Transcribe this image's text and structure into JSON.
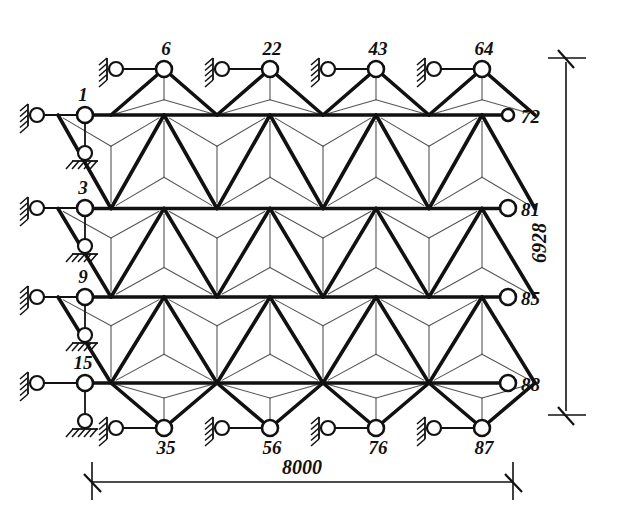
{
  "drawing": {
    "title": "Kagome lattice truss structure diagram",
    "background_color": "#ffffff",
    "ink_color": "#111111",
    "thick_member_color": "#111111",
    "thin_member_color": "#555555"
  },
  "dimensions": {
    "width_label": "8000",
    "height_label": "6928"
  },
  "nodes": {
    "left": [
      {
        "id": "1",
        "label": "1",
        "x": 85,
        "y": 115,
        "support": "pin-horizontal-and-vertical"
      },
      {
        "id": "3",
        "label": "3",
        "x": 85,
        "y": 208,
        "support": "pin-horizontal-and-vertical"
      },
      {
        "id": "9",
        "label": "9",
        "x": 85,
        "y": 297,
        "support": "pin-horizontal-and-vertical"
      },
      {
        "id": "15",
        "label": "15",
        "x": 85,
        "y": 383,
        "support": "pin-horizontal-and-vertical"
      }
    ],
    "top": [
      {
        "id": "6",
        "label": "6",
        "x": 164,
        "y": 69,
        "support": "pin-horizontal"
      },
      {
        "id": "22",
        "label": "22",
        "x": 270,
        "y": 69,
        "support": "pin-horizontal"
      },
      {
        "id": "43",
        "label": "43",
        "x": 376,
        "y": 69,
        "support": "pin-horizontal"
      },
      {
        "id": "64",
        "label": "64",
        "x": 482,
        "y": 69,
        "support": "pin-horizontal"
      }
    ],
    "right": [
      {
        "id": "72",
        "label": "72",
        "x": 508,
        "y": 115,
        "support": "free"
      },
      {
        "id": "81",
        "label": "81",
        "x": 508,
        "y": 208,
        "support": "free"
      },
      {
        "id": "85",
        "label": "85",
        "x": 508,
        "y": 297,
        "support": "free"
      },
      {
        "id": "88",
        "label": "88",
        "x": 508,
        "y": 383,
        "support": "free"
      }
    ],
    "bottom": [
      {
        "id": "35",
        "label": "35",
        "x": 164,
        "y": 428,
        "support": "pin-horizontal"
      },
      {
        "id": "56",
        "label": "56",
        "x": 270,
        "y": 428,
        "support": "pin-horizontal"
      },
      {
        "id": "76",
        "label": "76",
        "x": 376,
        "y": 428,
        "support": "pin-horizontal"
      },
      {
        "id": "87",
        "label": "87",
        "x": 482,
        "y": 428,
        "support": "pin-horizontal"
      }
    ]
  },
  "legend": {
    "chord_lines": 4,
    "triangle_internal": "three thin lines from each triangle vertex to its centroid"
  }
}
